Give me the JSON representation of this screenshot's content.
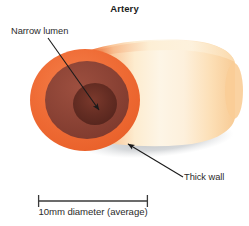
{
  "figure": {
    "title": "Artery",
    "background_color": "#ffffff",
    "width": 249,
    "height": 226
  },
  "annotations": [
    {
      "id": "narrow-lumen",
      "label": "Narrow lumen",
      "target": "lumen",
      "leader_from": [
        48,
        38
      ],
      "leader_to": [
        100,
        111
      ]
    },
    {
      "id": "thick-wall",
      "label": "Thick wall",
      "target": "wall",
      "leader_from": [
        183,
        177
      ],
      "leader_to": [
        126,
        143
      ]
    }
  ],
  "scale_bar": {
    "caption": "10mm diameter (average)",
    "x_start": 38,
    "x_end": 148,
    "y": 201,
    "color": "#3a3a3a"
  },
  "vessel": {
    "name": "artery",
    "layers": [
      {
        "name": "wall",
        "label": "Thick wall",
        "color": "#ee6a35"
      },
      {
        "name": "media",
        "color": "#8b4237"
      },
      {
        "name": "lumen",
        "label": "Narrow lumen",
        "color": "#5e2b23"
      }
    ],
    "body_gradient": [
      "#ef7a3e",
      "#fbf0dc",
      "#fad9ae"
    ],
    "shadow_color": "#c9cbcd"
  },
  "colors": {
    "orange_wall": "#ee6a35",
    "media_brown": "#8b4237",
    "lumen_dark": "#5e2b23",
    "cream": "#fbf2e0",
    "shadow": "#c9cbcd",
    "text": "#2b2b2b",
    "leader_line": "#1a1a1a"
  }
}
